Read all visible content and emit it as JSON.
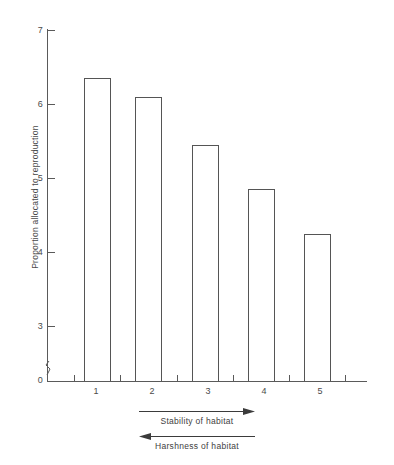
{
  "chart_data": {
    "type": "bar",
    "title": "",
    "subtitle": "",
    "xlabel": "",
    "ylabel": "Proportion allocated to reproduction",
    "categories": [
      "1",
      "2",
      "3",
      "4",
      "5"
    ],
    "values": [
      6.35,
      6.1,
      5.45,
      4.85,
      4.25
    ],
    "series": [
      {
        "name": "Proportion allocated to reproduction",
        "values": [
          6.35,
          6.1,
          5.45,
          4.85,
          4.25
        ]
      }
    ],
    "ylim": [
      0,
      7
    ],
    "yticks": [
      7,
      6,
      5,
      4,
      3,
      0
    ],
    "ytick_labels": [
      "7",
      "6",
      "5",
      "4",
      "3",
      "0"
    ],
    "xtick_labels": [
      "1",
      "2",
      "3",
      "4",
      "5"
    ],
    "grid": false,
    "legend": false,
    "legend_position": "none",
    "axis_break": true,
    "axis_break_note": "y-axis broken between 3 and 0",
    "bar_fill": "#ffffff",
    "bar_edge_color": "#555555",
    "axis_color": "#5a5a5a",
    "background": "#ffffff",
    "annotations": [
      {
        "text": "Stability of habitat",
        "arrow_direction": "right"
      },
      {
        "text": "Harshness of habitat",
        "arrow_direction": "left"
      }
    ]
  },
  "axis": {
    "y_title": "Proportion allocated to reproduction",
    "y_labels": {
      "t7": "7",
      "t6": "6",
      "t5": "5",
      "t4": "4",
      "t3": "3",
      "t0": "0"
    },
    "x_labels": {
      "c1": "1",
      "c2": "2",
      "c3": "3",
      "c4": "4",
      "c5": "5"
    }
  },
  "footnotes": {
    "stability": "Stability of habitat",
    "harshness": "Harshness of habitat"
  }
}
